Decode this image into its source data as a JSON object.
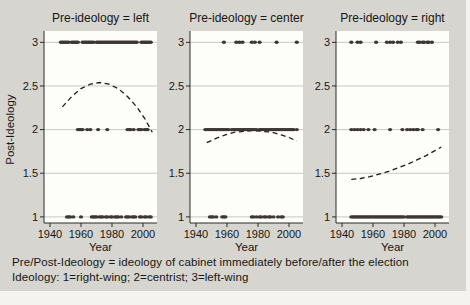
{
  "figure": {
    "caption_line1": "Pre/Post-Ideology = ideology of cabinet immediately before/after the election",
    "caption_line2": "Ideology: 1=right-wing; 2=centrist; 3=left-wing",
    "colors": {
      "background": "#d6d5cf",
      "plot_background": "#fdfdfa",
      "gridline": "#c6cac3",
      "axis": "#2a2a2a",
      "text": "#161616",
      "dot": "#3b3734",
      "trend": "#1c1c1c"
    }
  },
  "chart_data": {
    "type": "scatter",
    "layout": "three small-multiple panels by pre-election ideology, dashed lowess trend in each",
    "xlabel": "Year",
    "ylabel": "Post-Ideology",
    "x_ticks": [
      1940,
      1960,
      1980,
      2000
    ],
    "y_ticks": [
      1,
      1.5,
      2,
      2.5,
      3
    ],
    "xlim": [
      1937,
      2009
    ],
    "ylim": [
      0.93,
      3.13
    ],
    "grid": true,
    "legend_position": "none",
    "panels": [
      {
        "title": "Pre-ideology = left",
        "points": {
          "3": [
            1947,
            1948,
            1949,
            1950,
            1951,
            1952,
            1954,
            1955,
            1956,
            1957,
            1958,
            1961,
            1962,
            1963,
            1964,
            1965,
            1966,
            1967,
            1968,
            1970,
            1971,
            1972,
            1973,
            1974,
            1975,
            1976,
            1977,
            1978,
            1979,
            1980,
            1981,
            1982,
            1983,
            1984,
            1985,
            1986,
            1987,
            1988,
            1989,
            1990,
            1991,
            1992,
            1993,
            1994,
            1995,
            1996,
            1999,
            2000,
            2001,
            2002,
            2003,
            2004,
            2005
          ],
          "2": [
            1958,
            1959,
            1960,
            1961,
            1964,
            1966,
            1971,
            1977,
            1990,
            1991,
            1992,
            1994,
            1997,
            1998,
            1999,
            2001,
            2002,
            2003
          ],
          "1": [
            1951,
            1952,
            1953,
            1955,
            1960,
            1967,
            1968,
            1969,
            1970,
            1972,
            1973,
            1974,
            1976,
            1977,
            1979,
            1980,
            1982,
            1983,
            1984,
            1986,
            1989,
            1990,
            1991,
            1993,
            1994,
            1995,
            1998,
            1999,
            2001,
            2002,
            2004,
            2005
          ]
        },
        "trend_dashed": [
          [
            1948,
            2.26
          ],
          [
            1954,
            2.38
          ],
          [
            1960,
            2.47
          ],
          [
            1966,
            2.52
          ],
          [
            1972,
            2.54
          ],
          [
            1978,
            2.52
          ],
          [
            1984,
            2.47
          ],
          [
            1990,
            2.38
          ],
          [
            1996,
            2.26
          ],
          [
            2001,
            2.13
          ],
          [
            2006,
            1.97
          ]
        ]
      },
      {
        "title": "Pre-ideology = center",
        "points": {
          "3": [
            1958,
            1966,
            1968,
            1970,
            1976,
            1978,
            1981,
            1992,
            2005
          ],
          "2": [
            1946,
            1947,
            1948,
            1949,
            1950,
            1951,
            1952,
            1953,
            1954,
            1955,
            1956,
            1957,
            1958,
            1959,
            1960,
            1961,
            1963,
            1964,
            1965,
            1966,
            1967,
            1968,
            1969,
            1970,
            1971,
            1972,
            1973,
            1974,
            1975,
            1976,
            1977,
            1978,
            1979,
            1981,
            1982,
            1983,
            1984,
            1985,
            1986,
            1987,
            1988,
            1989,
            1990,
            1991,
            1992,
            1993,
            1994,
            1995,
            1996,
            1997,
            1998,
            1999,
            2000,
            2001,
            2002,
            2003,
            2005
          ],
          "1": [
            1949,
            1950,
            1951,
            1953,
            1957,
            1958,
            1959,
            1976,
            1977,
            1979,
            1981,
            1982,
            1984,
            1985,
            1987,
            1988,
            1990,
            1993,
            1995,
            1996
          ]
        },
        "trend_dashed": [
          [
            1947,
            1.85
          ],
          [
            1953,
            1.9
          ],
          [
            1959,
            1.94
          ],
          [
            1965,
            1.97
          ],
          [
            1971,
            1.98
          ],
          [
            1977,
            1.99
          ],
          [
            1983,
            1.98
          ],
          [
            1989,
            1.97
          ],
          [
            1995,
            1.94
          ],
          [
            2000,
            1.91
          ],
          [
            2005,
            1.87
          ]
        ]
      },
      {
        "title": "Pre-ideology = right",
        "points": {
          "3": [
            1946,
            1950,
            1952,
            1962,
            1969,
            1971,
            1973,
            1976,
            1978,
            1989,
            1990,
            1992,
            1993,
            1995,
            1996,
            1998
          ],
          "2": [
            1946,
            1948,
            1950,
            1952,
            1954,
            1957,
            1961,
            1971,
            1979,
            1982,
            1984,
            1986,
            1988,
            1989,
            1992,
            2002
          ],
          "1": [
            1946,
            1947,
            1948,
            1949,
            1950,
            1951,
            1952,
            1953,
            1954,
            1955,
            1956,
            1957,
            1958,
            1959,
            1960,
            1961,
            1962,
            1963,
            1964,
            1965,
            1966,
            1967,
            1968,
            1969,
            1970,
            1971,
            1972,
            1973,
            1974,
            1975,
            1976,
            1977,
            1978,
            1979,
            1980,
            1982,
            1983,
            1984,
            1985,
            1986,
            1987,
            1988,
            1989,
            1990,
            1991,
            1992,
            1993,
            1994,
            1995,
            1996,
            1997,
            1998,
            1999,
            2000,
            2001,
            2002,
            2003,
            2004
          ]
        },
        "trend_dashed": [
          [
            1946,
            1.43
          ],
          [
            1952,
            1.44
          ],
          [
            1958,
            1.46
          ],
          [
            1964,
            1.49
          ],
          [
            1970,
            1.52
          ],
          [
            1976,
            1.56
          ],
          [
            1982,
            1.6
          ],
          [
            1988,
            1.65
          ],
          [
            1994,
            1.7
          ],
          [
            2000,
            1.76
          ],
          [
            2004,
            1.8
          ]
        ]
      }
    ]
  }
}
